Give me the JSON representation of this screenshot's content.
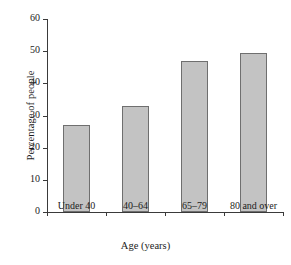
{
  "chart_data": {
    "type": "bar",
    "title": "",
    "xlabel": "Age (years)",
    "ylabel": "Percentage of people",
    "categories": [
      "Under 40",
      "40–64",
      "65–79",
      "80 and over"
    ],
    "values": [
      27,
      33,
      47,
      49.4
    ],
    "ylim": [
      0,
      60
    ],
    "yticks": [
      0,
      10,
      20,
      30,
      40,
      50,
      60
    ],
    "ytick_labels": [
      "0",
      "10",
      "20",
      "30",
      "40",
      "50",
      "60"
    ],
    "grid": false,
    "legend": "none",
    "bar_fill_color": "#c3c3c3",
    "bar_edge_color": "#6f6f6f",
    "axis_color": "#3a3a3a",
    "background_color": "#ffffff"
  }
}
